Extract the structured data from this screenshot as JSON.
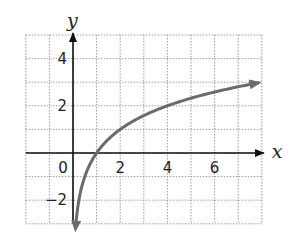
{
  "chart_data": {
    "type": "line",
    "title": "",
    "function": "y = log2(x)",
    "xlabel": "x",
    "ylabel": "y",
    "xlim": [
      -2,
      8
    ],
    "ylim": [
      -3,
      5
    ],
    "grid": true,
    "grid_step": 1,
    "x_ticks": [
      {
        "value": 0,
        "label": "0"
      },
      {
        "value": 2,
        "label": "2"
      },
      {
        "value": 4,
        "label": "4"
      },
      {
        "value": 6,
        "label": "6"
      }
    ],
    "y_ticks": [
      {
        "value": 4,
        "label": "4"
      },
      {
        "value": 2,
        "label": "2"
      },
      {
        "value": -2,
        "label": "−2"
      }
    ],
    "series": [
      {
        "name": "log curve",
        "color": "#6b6b6b",
        "x": [
          0.125,
          0.25,
          0.5,
          1,
          2,
          3,
          4,
          5,
          6,
          7,
          7.9
        ],
        "values": [
          -3,
          -2,
          -1,
          0,
          1,
          1.585,
          2,
          2.32,
          2.585,
          2.81,
          2.98
        ],
        "arrow_ends": true
      }
    ]
  },
  "labels": {
    "x_axis": "x",
    "y_axis": "y",
    "origin": "0"
  }
}
